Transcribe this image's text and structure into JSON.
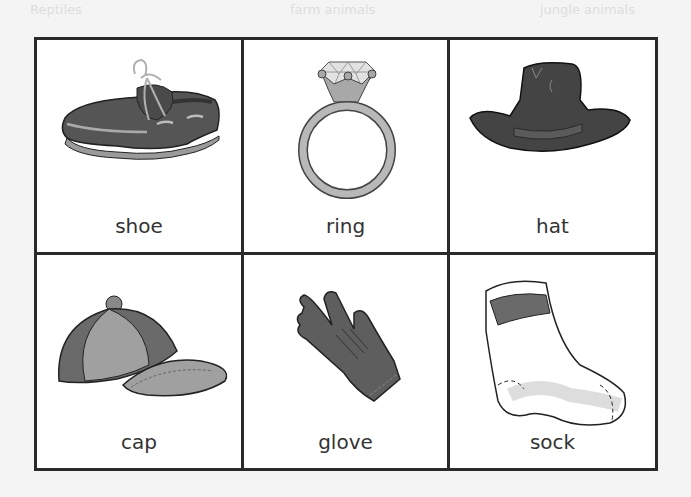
{
  "background_text": [
    "Reptiles",
    "farm animals",
    "jungle animals"
  ],
  "cards": [
    {
      "label": "shoe",
      "icon": "shoe-icon"
    },
    {
      "label": "ring",
      "icon": "ring-icon"
    },
    {
      "label": "hat",
      "icon": "hat-icon"
    },
    {
      "label": "cap",
      "icon": "cap-icon"
    },
    {
      "label": "glove",
      "icon": "glove-icon"
    },
    {
      "label": "sock",
      "icon": "sock-icon"
    }
  ],
  "colors": {
    "border": "#2a2a2a",
    "dark_gray": "#555555",
    "mid_gray": "#8a8a8a",
    "light_gray": "#c8c8c8"
  }
}
